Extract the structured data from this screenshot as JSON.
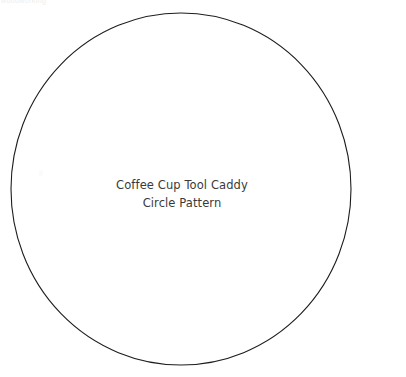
{
  "page": {
    "width": 406,
    "height": 377,
    "background_color": "#ffffff",
    "document_type": "printable pattern template"
  },
  "header": {
    "watermark_text": "woodworking",
    "color": "#eeeeee"
  },
  "artifact": {
    "name": "faint-stray-mark",
    "color": "#fbfbfb"
  },
  "shape": {
    "type": "circle",
    "label": "pattern-circle",
    "center_x": 181,
    "center_y": 189,
    "radius_x": 170,
    "radius_y": 176,
    "stroke_color": "#1d1d1d",
    "stroke_width": 1,
    "fill": "none"
  },
  "caption": {
    "line1": "Coffee Cup Tool Caddy",
    "line2": "Circle Pattern",
    "color": "#3a3a3a",
    "align": "center"
  }
}
